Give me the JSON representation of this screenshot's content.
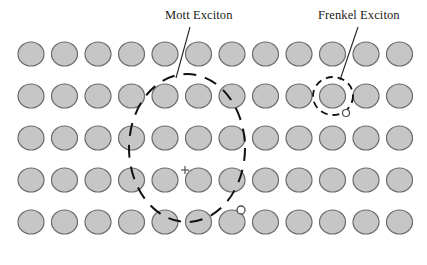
{
  "figure": {
    "type": "lattice-exciton-diagram",
    "width": 427,
    "height": 265,
    "background_color": "#ffffff"
  },
  "labels": {
    "mott": "Mott Exciton",
    "frenkel": "Frenkel Exciton"
  },
  "colors": {
    "atom_fill": "#c6c6c6",
    "atom_stroke": "#6b6b6b",
    "orbit_stroke": "#111111",
    "leader_stroke": "#222222",
    "text": "#1a1a1a",
    "electron_fill": "#ffffff",
    "electron_stroke": "#4d4d4d"
  },
  "lattice": {
    "columns": 12,
    "rows": 5,
    "atom_radius_x": 13,
    "atom_radius_y": 12,
    "first_center_x": 31,
    "column_spacing": 33.5,
    "row_centers_y": [
      54,
      96,
      138,
      180,
      222
    ]
  },
  "mott_exciton": {
    "name": "Mott Exciton",
    "orbit_center_x": 187,
    "orbit_center_y": 148,
    "orbit_radius_x": 58,
    "orbit_radius_y": 74,
    "dash_pattern": "13 9",
    "hole_marker": "+",
    "hole_x": 185,
    "hole_y": 170,
    "electron_x": 241,
    "electron_y": 210,
    "electron_radius": 4,
    "leader_line": {
      "x1": 190,
      "y1": 27,
      "x2": 176,
      "y2": 78
    }
  },
  "frenkel_exciton": {
    "name": "Frenkel Exciton",
    "orbit_center_x": 333,
    "orbit_center_y": 96,
    "orbit_radius_x": 20,
    "orbit_radius_y": 19,
    "dash_pattern": "7 5",
    "electron_x": 346,
    "electron_y": 113,
    "electron_radius": 3.5,
    "leader_line": {
      "x1": 358,
      "y1": 27,
      "x2": 340,
      "y2": 80
    }
  }
}
